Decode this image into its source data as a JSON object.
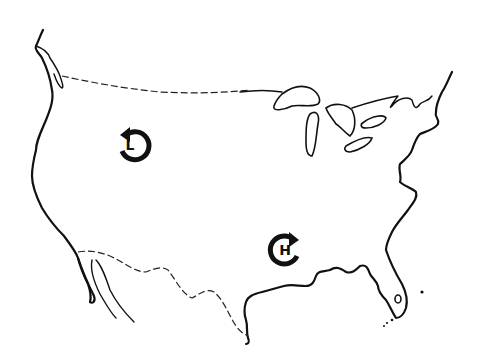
{
  "map": {
    "subject": "Continental United States outline",
    "style": "black line drawing on white",
    "colors": {
      "background": "#ffffff",
      "ink": "#111111"
    },
    "features": [
      "Pacific coastline",
      "Canada border (dashed)",
      "Great Lakes",
      "Atlantic coastline",
      "Gulf of Mexico coastline",
      "Florida peninsula",
      "Mexico border (dashed)",
      "Baja California"
    ]
  },
  "symbols": [
    {
      "id": "low",
      "label": "L",
      "meaning": "low pressure",
      "rotation": "counterclockwise",
      "position": "northwest interior"
    },
    {
      "id": "high",
      "label": "H",
      "meaning": "high pressure",
      "rotation": "clockwise",
      "position": "south-central interior"
    }
  ]
}
